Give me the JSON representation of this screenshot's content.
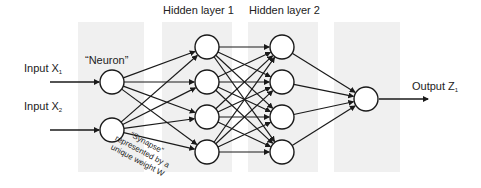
{
  "labels": {
    "input1": "Input X",
    "input1_sub": "1",
    "input2": "Input X",
    "input2_sub": "2",
    "neuron": "“Neuron”",
    "hidden1": "Hidden layer 1",
    "hidden2": "Hidden layer 2",
    "output": "Output Z",
    "output_sub": "1",
    "synapse_line1": "“Synapse”",
    "synapse_line2": "represented by a",
    "synapse_line3": "unique weight W"
  },
  "network": {
    "layers": [
      {
        "name": "input",
        "nodes": 2
      },
      {
        "name": "hidden1",
        "nodes": 4
      },
      {
        "name": "hidden2",
        "nodes": 4
      },
      {
        "name": "output",
        "nodes": 1
      }
    ]
  },
  "colors": {
    "panel": "#f0f0f0",
    "stroke": "#1a1a1a",
    "node_fill": "#ffffff"
  }
}
